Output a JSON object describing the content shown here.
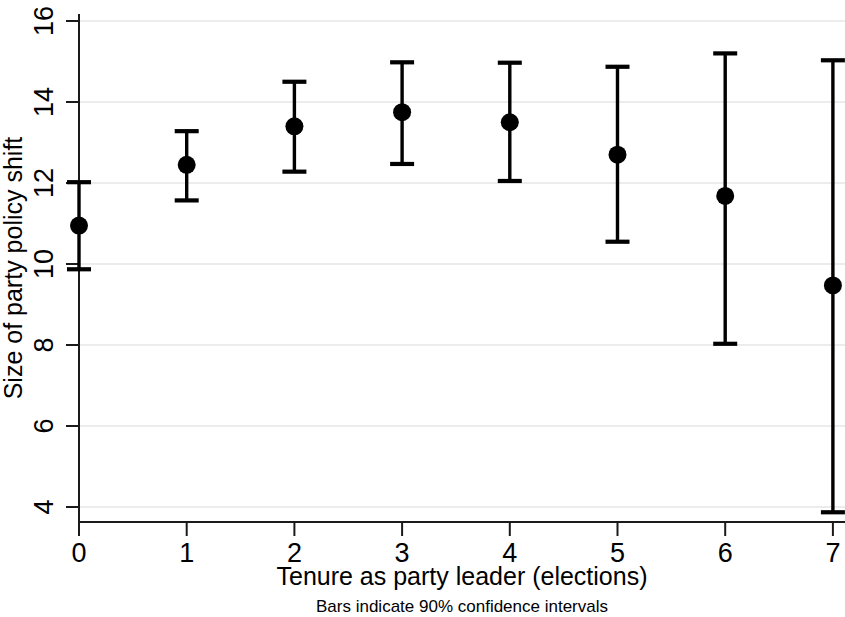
{
  "chart_data": {
    "type": "scatter",
    "title": "",
    "subtitle": "",
    "xlabel": "Tenure as party leader (elections)",
    "ylabel": "Size of party policy shift",
    "note": "Bars indicate 90% confidence intervals",
    "x": [
      0,
      1,
      2,
      3,
      4,
      5,
      6,
      7
    ],
    "xtick_labels": [
      "0",
      "1",
      "2",
      "3",
      "4",
      "5",
      "6",
      "7"
    ],
    "ytick_labels": [
      "4",
      "6",
      "8",
      "10",
      "12",
      "14",
      "16"
    ],
    "yticks": [
      4,
      6,
      8,
      10,
      12,
      14,
      16
    ],
    "xlim": [
      -0.25,
      7.1
    ],
    "ylim": [
      3.75,
      16.0
    ],
    "grid": "horizontal",
    "grid_color": "#d9d9d9",
    "marker_color": "#000000",
    "error_bar_color": "#000000",
    "legend": "none",
    "values": [
      10.95,
      12.45,
      13.4,
      13.75,
      13.5,
      12.7,
      11.68,
      9.47
    ],
    "ci_low": [
      9.87,
      11.57,
      12.28,
      12.47,
      12.05,
      10.55,
      8.03,
      3.87
    ],
    "ci_high": [
      12.02,
      13.28,
      14.5,
      14.98,
      14.97,
      14.87,
      15.2,
      15.03
    ],
    "points": [
      {
        "x": 0,
        "estimate": 10.95,
        "low": 9.87,
        "high": 12.02
      },
      {
        "x": 1,
        "estimate": 12.45,
        "low": 11.57,
        "high": 13.28
      },
      {
        "x": 2,
        "estimate": 13.4,
        "low": 12.28,
        "high": 14.5
      },
      {
        "x": 3,
        "estimate": 13.75,
        "low": 12.47,
        "high": 14.98
      },
      {
        "x": 4,
        "estimate": 13.5,
        "low": 12.05,
        "high": 14.97
      },
      {
        "x": 5,
        "estimate": 12.7,
        "low": 10.55,
        "high": 14.87
      },
      {
        "x": 6,
        "estimate": 11.68,
        "low": 8.03,
        "high": 15.2
      },
      {
        "x": 7,
        "estimate": 9.47,
        "low": 3.87,
        "high": 15.03
      }
    ]
  }
}
